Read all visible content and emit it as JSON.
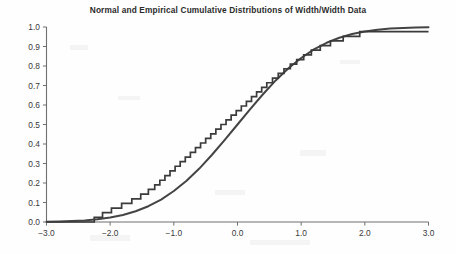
{
  "chart_data": {
    "type": "line",
    "title": "Normal and Empirical Cumulative Distributions of Width/Width Data",
    "xlabel": "",
    "ylabel": "",
    "xlim": [
      -3.0,
      3.0
    ],
    "ylim": [
      0.0,
      1.0
    ],
    "xticks": [
      "-3.0",
      "-2.0",
      "-1.0",
      "0.0",
      "1.0",
      "2.0",
      "3.0"
    ],
    "xtick_values": [
      -3.0,
      -2.0,
      -1.0,
      0.0,
      1.0,
      2.0,
      3.0
    ],
    "yticks": [
      "0.0",
      "0.1",
      "0.2",
      "0.3",
      "0.4",
      "0.5",
      "0.6",
      "0.7",
      "0.8",
      "0.9",
      "1.0"
    ],
    "ytick_values": [
      0.0,
      0.1,
      0.2,
      0.3,
      0.4,
      0.5,
      0.6,
      0.7,
      0.8,
      0.9,
      1.0
    ],
    "grid": false,
    "legend": "none",
    "series": [
      {
        "name": "Normal cumulative distribution",
        "kind": "smooth",
        "x": [
          -3.0,
          -2.8,
          -2.6,
          -2.4,
          -2.2,
          -2.0,
          -1.8,
          -1.6,
          -1.4,
          -1.2,
          -1.0,
          -0.8,
          -0.6,
          -0.4,
          -0.2,
          0.0,
          0.2,
          0.4,
          0.6,
          0.8,
          1.0,
          1.2,
          1.4,
          1.6,
          1.8,
          2.0,
          2.2,
          2.4,
          2.6,
          2.8,
          3.0
        ],
        "values": [
          0.001,
          0.003,
          0.005,
          0.008,
          0.014,
          0.023,
          0.036,
          0.055,
          0.081,
          0.115,
          0.159,
          0.212,
          0.274,
          0.345,
          0.421,
          0.5,
          0.579,
          0.655,
          0.726,
          0.788,
          0.841,
          0.885,
          0.919,
          0.945,
          0.964,
          0.977,
          0.986,
          0.992,
          0.995,
          0.997,
          0.999
        ]
      },
      {
        "name": "Empirical cumulative distribution",
        "kind": "step",
        "x": [
          -2.25,
          -2.12,
          -1.98,
          -1.82,
          -1.66,
          -1.52,
          -1.4,
          -1.3,
          -1.22,
          -1.14,
          -1.06,
          -0.98,
          -0.9,
          -0.82,
          -0.74,
          -0.66,
          -0.58,
          -0.5,
          -0.42,
          -0.34,
          -0.26,
          -0.18,
          -0.1,
          -0.02,
          0.06,
          0.14,
          0.22,
          0.3,
          0.38,
          0.46,
          0.55,
          0.64,
          0.73,
          0.83,
          0.93,
          1.04,
          1.16,
          1.3,
          1.46,
          1.66,
          1.92,
          2.25
        ],
        "values": [
          0.024,
          0.048,
          0.071,
          0.095,
          0.119,
          0.143,
          0.167,
          0.19,
          0.214,
          0.238,
          0.262,
          0.286,
          0.31,
          0.333,
          0.357,
          0.381,
          0.405,
          0.429,
          0.452,
          0.476,
          0.5,
          0.524,
          0.548,
          0.571,
          0.595,
          0.619,
          0.643,
          0.667,
          0.69,
          0.714,
          0.738,
          0.762,
          0.786,
          0.81,
          0.833,
          0.857,
          0.881,
          0.905,
          0.929,
          0.952,
          0.976,
          0.976
        ]
      }
    ]
  }
}
